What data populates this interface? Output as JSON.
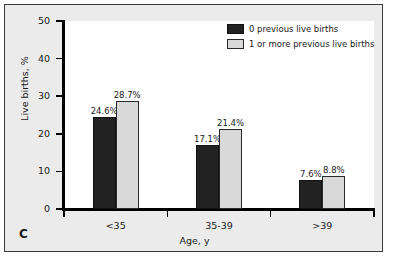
{
  "panel": {
    "label": "C"
  },
  "legend": {
    "position": "top-right",
    "entries": [
      {
        "label": "0 previous live births",
        "color": "#222222",
        "swatch": "dark-swatch"
      },
      {
        "label": "1 or more previous live births",
        "color": "#d9d9d9",
        "swatch": "light-swatch"
      }
    ]
  },
  "axes": {
    "y_title": "Live births, %",
    "x_title": "Age, y",
    "y_ticks": [
      "0",
      "10",
      "20",
      "30",
      "40",
      "50"
    ],
    "x_ticks": [
      "<35",
      "35-39",
      ">39"
    ]
  },
  "chart_data": {
    "type": "bar",
    "title": "",
    "subtitle": "",
    "xlabel": "Age, y",
    "ylabel": "Live births, %",
    "categories": [
      "<35",
      "35-39",
      ">39"
    ],
    "series": [
      {
        "name": "0 previous live births",
        "color": "#222222",
        "values": [
          24.6,
          17.1,
          7.6
        ],
        "data_labels": [
          "24.6%",
          "17.1%",
          "7.6%"
        ]
      },
      {
        "name": "1 or more previous live births",
        "color": "#d9d9d9",
        "values": [
          28.7,
          21.4,
          8.8
        ],
        "data_labels": [
          "28.7%",
          "21.4%",
          "8.8%"
        ]
      }
    ],
    "ylim": [
      0,
      50
    ],
    "ytick_step": 10,
    "grid": false,
    "legend_position": "top-right",
    "panel_label": "C"
  }
}
